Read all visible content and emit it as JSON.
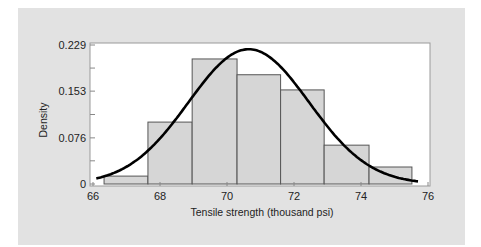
{
  "chart_data": {
    "type": "bar",
    "subtype": "histogram_with_normal_curve",
    "title": "",
    "xlabel": "Tensile strength (thousand psi)",
    "ylabel": "Density",
    "xlim": [
      66,
      76
    ],
    "ylim": [
      0,
      0.229
    ],
    "x_ticks": [
      66,
      68,
      70,
      72,
      74,
      76
    ],
    "x_tick_labels": [
      "66",
      "68",
      "70",
      "72",
      "74",
      "76"
    ],
    "y_ticks": [
      0,
      0.076,
      0.153,
      0.229
    ],
    "y_tick_labels": [
      "0",
      "0.076",
      "0.153",
      "0.229"
    ],
    "grid": false,
    "bins": [
      {
        "left": 66.33,
        "right": 67.64,
        "density": 0.013
      },
      {
        "left": 67.64,
        "right": 68.96,
        "density": 0.102
      },
      {
        "left": 68.96,
        "right": 70.3,
        "density": 0.206
      },
      {
        "left": 70.3,
        "right": 71.6,
        "density": 0.18
      },
      {
        "left": 71.6,
        "right": 72.9,
        "density": 0.155
      },
      {
        "left": 72.9,
        "right": 74.24,
        "density": 0.064
      },
      {
        "left": 74.24,
        "right": 75.52,
        "density": 0.028
      }
    ],
    "series": [
      {
        "name": "Histogram",
        "values": [
          0.013,
          0.102,
          0.206,
          0.18,
          0.155,
          0.064,
          0.028
        ]
      },
      {
        "name": "Normal density curve",
        "type": "line",
        "mean": 70.65,
        "sd": 1.8,
        "peak": 0.222,
        "x_range": [
          66.1,
          75.7
        ]
      }
    ],
    "colors": {
      "bar_fill": "#d6d6d6",
      "bar_edge": "#555555",
      "curve": "#000000",
      "panel_bg": "#e2e2e2",
      "plot_bg": "#ffffff"
    }
  }
}
